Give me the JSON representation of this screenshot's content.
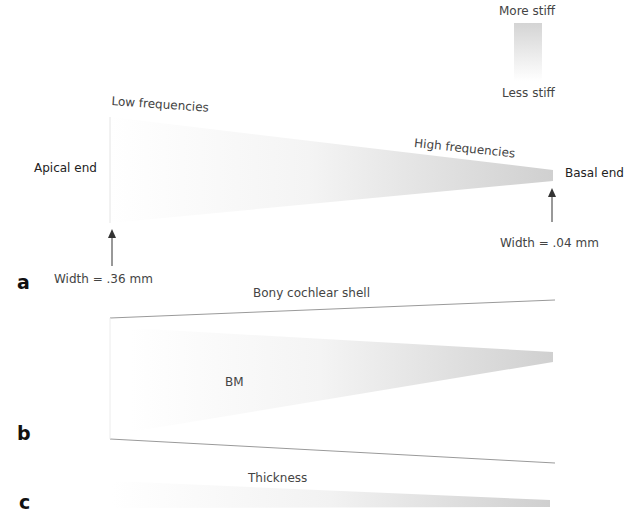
{
  "legend": {
    "top_label": "More stiff",
    "bottom_label": "Less stiff",
    "gradient_top_color": "#d6d6d6",
    "gradient_bottom_color": "#ffffff"
  },
  "panel_a": {
    "letter": "a",
    "apical_label": "Apical end",
    "basal_label": "Basal end",
    "low_freq_label": "Low frequencies",
    "high_freq_label": "High frequencies",
    "apical_width_label": "Width = .36 mm",
    "basal_width_label": "Width = .04 mm"
  },
  "panel_b": {
    "letter": "b",
    "shell_label": "Bony cochlear shell",
    "bm_label": "BM"
  },
  "panel_c": {
    "letter": "c",
    "thickness_label": "Thickness"
  },
  "colors": {
    "membrane_light": "#ffffff",
    "membrane_dark": "#d2d2d2",
    "line": "#9a9a9a",
    "arrow": "#333333"
  }
}
